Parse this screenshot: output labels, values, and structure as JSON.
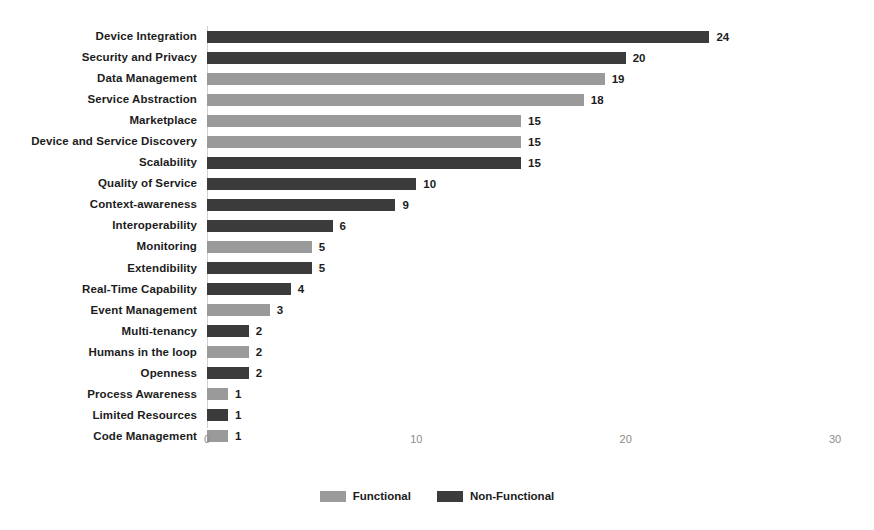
{
  "chart_data": {
    "type": "bar",
    "orientation": "horizontal",
    "title": "",
    "xlabel": "",
    "ylabel": "",
    "xlim": [
      0,
      30
    ],
    "xticks": [
      0,
      10,
      20,
      30
    ],
    "grid": false,
    "legend_position": "bottom-center",
    "categories": [
      "Device Integration",
      "Security and Privacy",
      "Data Management",
      "Service Abstraction",
      "Marketplace",
      "Device and Service Discovery",
      "Scalability",
      "Quality of Service",
      "Context-awareness",
      "Interoperability",
      "Monitoring",
      "Extendibility",
      "Real-Time Capability",
      "Event Management",
      "Multi-tenancy",
      "Humans in the loop",
      "Openness",
      "Process Awareness",
      "Limited Resources",
      "Code Management"
    ],
    "values": [
      24,
      20,
      19,
      18,
      15,
      15,
      15,
      10,
      9,
      6,
      5,
      5,
      4,
      3,
      2,
      2,
      2,
      1,
      1,
      1
    ],
    "series_of_bar": [
      "Non-Functional",
      "Non-Functional",
      "Functional",
      "Functional",
      "Functional",
      "Functional",
      "Non-Functional",
      "Non-Functional",
      "Non-Functional",
      "Non-Functional",
      "Functional",
      "Non-Functional",
      "Non-Functional",
      "Functional",
      "Non-Functional",
      "Functional",
      "Non-Functional",
      "Functional",
      "Non-Functional",
      "Functional"
    ],
    "legend": [
      {
        "name": "Functional",
        "color": "#9a9a9a"
      },
      {
        "name": "Non-Functional",
        "color": "#3b3b3b"
      }
    ],
    "colors": {
      "functional": "#9a9a9a",
      "non_functional": "#3b3b3b",
      "axis": "#d0d0d0",
      "tick_label": "#8c8c8c",
      "text": "#1c1c1c",
      "background": "#ffffff"
    }
  }
}
